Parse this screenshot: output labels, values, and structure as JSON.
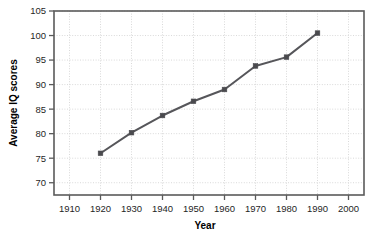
{
  "chart_data": {
    "type": "line",
    "title": "",
    "xlabel": "Year",
    "ylabel": "Average IQ scores",
    "x": [
      1920,
      1930,
      1940,
      1950,
      1960,
      1970,
      1980,
      1990
    ],
    "values": [
      76.0,
      80.2,
      83.7,
      86.6,
      89.0,
      93.8,
      95.6,
      100.5
    ],
    "series": [
      {
        "name": "Average IQ scores",
        "x": [
          1920,
          1930,
          1940,
          1950,
          1960,
          1970,
          1980,
          1990
        ],
        "values": [
          76.0,
          80.2,
          83.7,
          86.6,
          89.0,
          93.8,
          95.6,
          100.5
        ]
      }
    ],
    "xlim": [
      1905,
      2005
    ],
    "ylim": [
      67.5,
      105
    ],
    "xticks": [
      1910,
      1920,
      1930,
      1940,
      1950,
      1960,
      1970,
      1980,
      1990,
      2000
    ],
    "yticks": [
      70,
      75,
      80,
      85,
      90,
      95,
      100,
      105
    ],
    "xtick_labels": [
      "1910",
      "1920",
      "1930",
      "1940",
      "1950",
      "1960",
      "1970",
      "1980",
      "1990",
      "2000"
    ],
    "ytick_labels": [
      "70",
      "75",
      "80",
      "85",
      "90",
      "95",
      "100",
      "105"
    ],
    "grid": true,
    "grid_style": "dotted",
    "legend": false,
    "legend_position": "none",
    "marker": "square",
    "colors": {
      "line": "#56565a",
      "marker": "#4a4a4e",
      "grid": "#d9d9d9",
      "frame": "#5a5a5a",
      "text": "#1f1f1f",
      "background": "#ffffff"
    }
  }
}
